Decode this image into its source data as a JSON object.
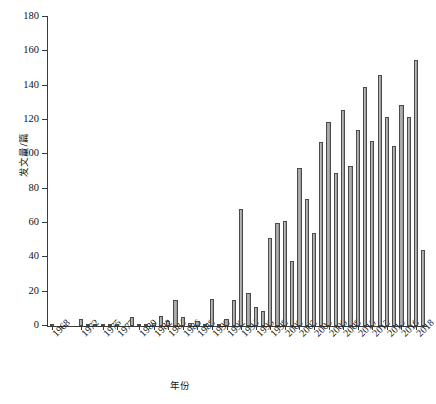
{
  "chart_data": {
    "type": "bar",
    "title": "",
    "xlabel": "年份",
    "ylabel": "发文量/篇",
    "ylim": [
      0,
      180
    ],
    "ytick_values": [
      0,
      20,
      40,
      60,
      80,
      100,
      120,
      140,
      160,
      180
    ],
    "ytick_labels": [
      "0",
      "20",
      "40",
      "60",
      "80",
      "100",
      "120",
      "140",
      "160",
      "180"
    ],
    "grid": false,
    "legend": null,
    "xtick_labels": [
      "1968",
      "1972",
      "1975",
      "1977",
      "1980",
      "1982",
      "1984",
      "1986",
      "1988",
      "1990",
      "1992",
      "1994",
      "1996",
      "1998",
      "2000",
      "2002",
      "2004",
      "2006",
      "2008",
      "2010",
      "2012",
      "2014",
      "2016",
      "2018"
    ],
    "categories": [
      "1968",
      "1969",
      "1970",
      "1971",
      "1972",
      "1973",
      "1974",
      "1975",
      "1976",
      "1977",
      "1978",
      "1979",
      "1980",
      "1981",
      "1982",
      "1983",
      "1984",
      "1985",
      "1986",
      "1987",
      "1988",
      "1989",
      "1990",
      "1991",
      "1992",
      "1993",
      "1994",
      "1995",
      "1996",
      "1997",
      "1998",
      "1999",
      "2000",
      "2001",
      "2002",
      "2003",
      "2004",
      "2005",
      "2006",
      "2007",
      "2008",
      "2009",
      "2010",
      "2011",
      "2012",
      "2013",
      "2014",
      "2015",
      "2016",
      "2017",
      "2018",
      "2019"
    ],
    "values": [
      1,
      0,
      0,
      0,
      4,
      1,
      1,
      1,
      1,
      1,
      0,
      5,
      1,
      1,
      2,
      6,
      3,
      15,
      5,
      2,
      3,
      1,
      16,
      1,
      4,
      15,
      68,
      19,
      11,
      9,
      51,
      60,
      61,
      38,
      92,
      74,
      54,
      107,
      119,
      89,
      126,
      93,
      114,
      139,
      108,
      146,
      122,
      105,
      129,
      122,
      155,
      44
    ]
  },
  "axes": {
    "y_title": "发文量/篇",
    "x_title": "年份"
  }
}
